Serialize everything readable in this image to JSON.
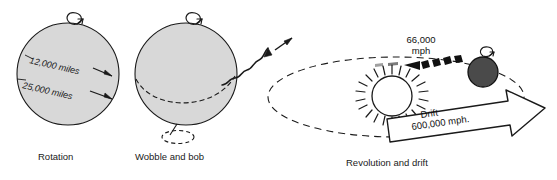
{
  "figure": {
    "background_color": "#ffffff",
    "ink_color": "#1a1a1a",
    "sphere_fill": "#d8d8d8",
    "earth_fill": "#4a4a4a"
  },
  "panels": [
    {
      "id": "rotation",
      "caption": "Rotation",
      "labels": {
        "diameter": "12,000 miles",
        "circumference": "25,000 miles"
      },
      "icons": {
        "spin": "rotation-curl-icon"
      }
    },
    {
      "id": "wobble",
      "caption": "Wobble and bob",
      "icons": {
        "spin": "rotation-curl-icon",
        "bob": "dashed-ellipse-icon",
        "wobble_path": "wavy-arrow-icon"
      }
    },
    {
      "id": "revolution",
      "caption": "Revolution and drift",
      "labels": {
        "orbital_speed_value": "66,000",
        "orbital_speed_unit": "mph",
        "drift_label": "Drift",
        "drift_speed": "600,000 mph."
      },
      "icons": {
        "sun": "sun-icon",
        "earth": "earth-icon",
        "orbit": "dashed-orbit-icon",
        "orbit_arrow": "left-arrow-icon",
        "drift_arrow": "block-arrow-icon",
        "spin": "rotation-curl-icon"
      }
    }
  ]
}
